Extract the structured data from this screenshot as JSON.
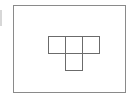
{
  "canvas": {
    "width": 134,
    "height": 99,
    "background_color": "#ffffff"
  },
  "edge_artifact": {
    "name": "clipped-edge-fragment",
    "color": "#c9c9c9"
  },
  "card": {
    "name": "shape-panel",
    "background_color": "#ffffff",
    "border_color": "#8a8a8a",
    "border_width_px": 1
  },
  "shape": {
    "name": "t-tetromino",
    "label": "T",
    "description": "T-shaped tetromino outline: three unit squares in the top row with one unit square centered below",
    "cell_size_px": 17,
    "outline_color": "#6b6b6b",
    "fill_color": "#ffffff",
    "grid": {
      "columns": 3,
      "rows": 2,
      "filled_cells": [
        {
          "row": 0,
          "col": 0,
          "filled": true
        },
        {
          "row": 0,
          "col": 1,
          "filled": true
        },
        {
          "row": 0,
          "col": 2,
          "filled": true
        },
        {
          "row": 1,
          "col": 0,
          "filled": false
        },
        {
          "row": 1,
          "col": 1,
          "filled": true
        },
        {
          "row": 1,
          "col": 2,
          "filled": false
        }
      ]
    },
    "cell_count": 4
  }
}
